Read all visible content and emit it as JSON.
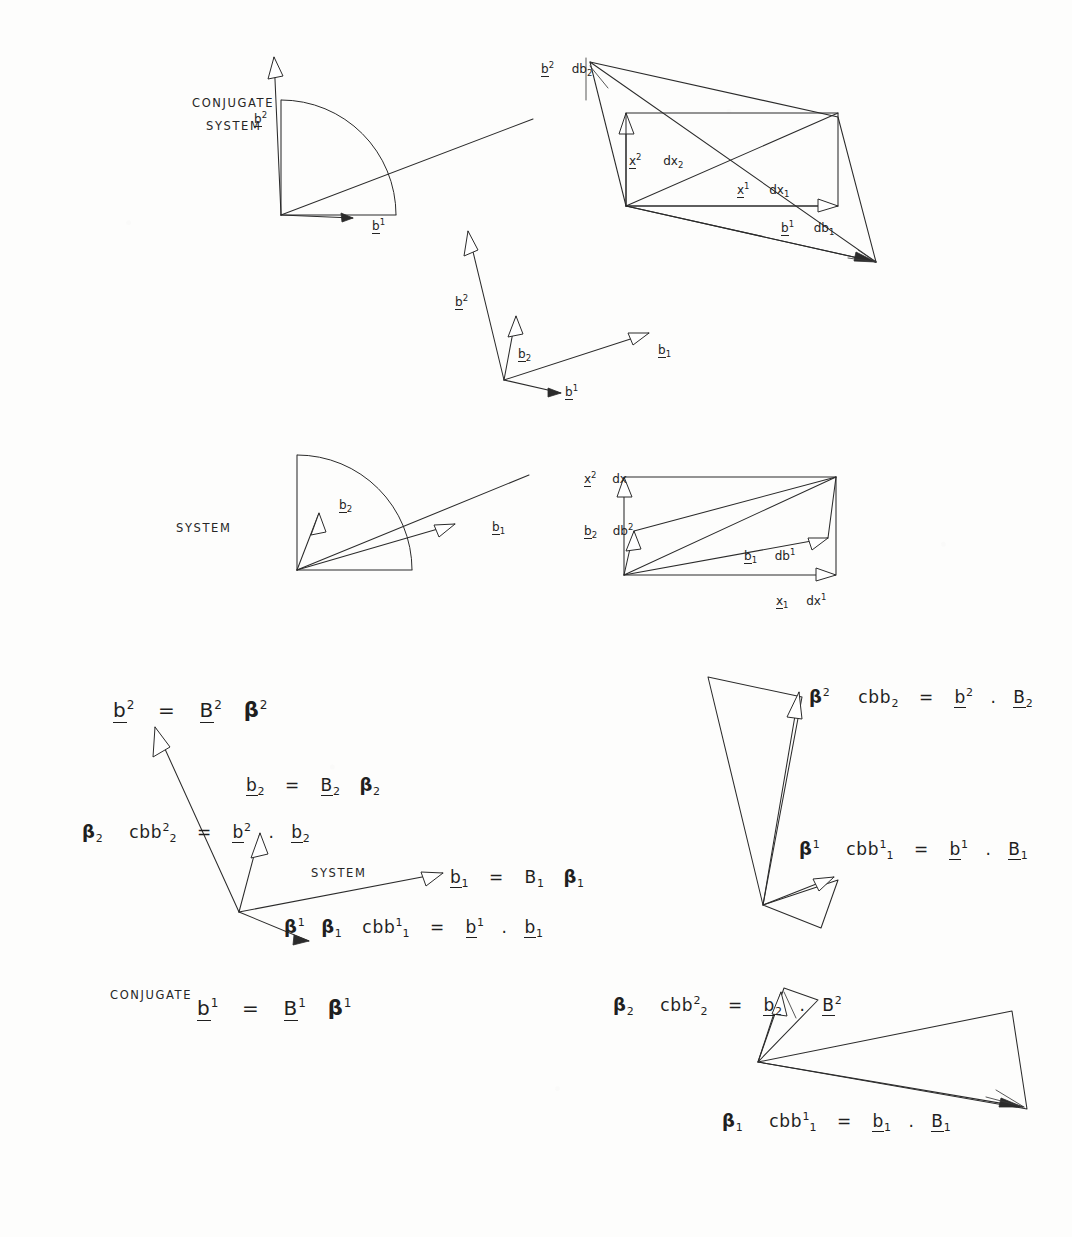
{
  "page": {
    "width": 1072,
    "height": 1237,
    "ink_color": "#2b2b2b",
    "paper_color": "#fdfdfc"
  },
  "captions": {
    "conjugate_system_top_line1": "CONJUGATE",
    "conjugate_system_top_line2": "SYSTEM",
    "system_middle": "SYSTEM",
    "system_lower": "SYSTEM",
    "conjugate_lower": "CONJUGATE"
  },
  "fig_top_left": {
    "name": "conjugate-system-quadrant",
    "labels": [
      {
        "base": "b",
        "sup": "2",
        "sub": "",
        "underline": true
      },
      {
        "base": "b",
        "sup": "1",
        "sub": "",
        "underline": true
      }
    ]
  },
  "fig_top_right": {
    "name": "conjugate-differential-parallelogram",
    "labels": [
      {
        "base": "b",
        "sup": "2",
        "sub": "2",
        "suffix": "db",
        "underline": true
      },
      {
        "base": "x",
        "sup": "2",
        "sub": "2",
        "suffix": "dx",
        "underline": true
      },
      {
        "base": "x",
        "sup": "1",
        "sub": "1",
        "suffix": "dx",
        "underline": true
      },
      {
        "base": "b",
        "sup": "1",
        "sub": "1",
        "suffix": "db",
        "underline": true
      }
    ]
  },
  "fig_middle": {
    "name": "combined-basis-vectors",
    "labels": [
      {
        "base": "b",
        "sup": "2",
        "sub": "",
        "underline": true
      },
      {
        "base": "b",
        "sup": "",
        "sub": "2",
        "underline": true
      },
      {
        "base": "b",
        "sup": "",
        "sub": "1",
        "underline": true
      },
      {
        "base": "b",
        "sup": "1",
        "sub": "",
        "underline": true
      }
    ]
  },
  "fig_row2_left": {
    "name": "system-quadrant",
    "labels": [
      {
        "base": "b",
        "sup": "",
        "sub": "2",
        "underline": true
      },
      {
        "base": "b",
        "sup": "",
        "sub": "1",
        "underline": true
      }
    ]
  },
  "fig_row2_right": {
    "name": "system-differential-parallelogram",
    "labels": [
      {
        "base": "x",
        "sup": "2",
        "sub": "2",
        "suffix": "dx",
        "underline": true
      },
      {
        "base": "b",
        "sup": "2",
        "sub": "2",
        "suffix": "db",
        "underline": true
      },
      {
        "base": "b",
        "sup": "",
        "sub": "1",
        "suffix": "db",
        "sup2": "1",
        "underline": true
      },
      {
        "base": "x",
        "sup": "1",
        "sub": "1",
        "suffix": "dx",
        "underline": true
      }
    ]
  },
  "equations": {
    "left_block": [
      {
        "id": "eq-b2-contra",
        "parts": [
          {
            "t": "b",
            "sup": "2",
            "u": true
          },
          {
            "t": "="
          },
          {
            "t": "B",
            "sup": "2",
            "u": true
          },
          {
            "t": "β",
            "sup": "2",
            "greek": true
          }
        ],
        "plain": "b^2 = B^2 β^2"
      },
      {
        "id": "eq-b2-co",
        "parts": [
          {
            "t": "b",
            "sub": "2",
            "u": true
          },
          {
            "t": "="
          },
          {
            "t": "B",
            "sub": "2",
            "u": true
          },
          {
            "t": "β",
            "sub": "2",
            "greek": true
          }
        ],
        "plain": "b_2 = B_2 β_2"
      },
      {
        "id": "eq-beta2-cbb",
        "parts": [
          {
            "t": "β",
            "sub": "2",
            "greek": true
          },
          {
            "t": "cbb",
            "sup": "2",
            "sub": "2"
          },
          {
            "t": "="
          },
          {
            "t": "b",
            "sup": "2",
            "u": true
          },
          {
            "t": "."
          },
          {
            "t": "b",
            "sub": "2",
            "u": true
          }
        ],
        "plain": "β_2 cbb^2_2 = b^2 . b_2"
      },
      {
        "id": "eq-b1-co",
        "parts": [
          {
            "t": "b",
            "sub": "1",
            "u": true
          },
          {
            "t": "="
          },
          {
            "t": "B",
            "sub": "1",
            "u": true
          },
          {
            "t": "β",
            "sub": "1",
            "greek": true
          }
        ],
        "plain": "b_1 = B_1 β_1"
      },
      {
        "id": "eq-beta1-cbb",
        "parts": [
          {
            "t": "β",
            "sup": "1",
            "greek": true
          },
          {
            "t": "β",
            "sub": "1",
            "greek": true
          },
          {
            "t": "cbb",
            "sup": "1",
            "sub": "1"
          },
          {
            "t": "="
          },
          {
            "t": "b",
            "sup": "1",
            "u": true
          },
          {
            "t": "."
          },
          {
            "t": "b",
            "sub": "1",
            "u": true
          }
        ],
        "plain": "β^1 β_1 cbb^1_1 = b^1 . b_1"
      },
      {
        "id": "eq-b1-contra",
        "parts": [
          {
            "t": "b",
            "sup": "1",
            "u": true
          },
          {
            "t": "="
          },
          {
            "t": "B",
            "sup": "1",
            "u": true
          },
          {
            "t": "β",
            "sup": "1",
            "greek": true
          }
        ],
        "plain": "b^1 = B^1 β^1"
      }
    ],
    "right_block": [
      {
        "id": "eq-r-beta2",
        "parts": [
          {
            "t": "β",
            "sup": "2",
            "greek": true
          },
          {
            "t": "cbb",
            "sup": "2",
            "sub": "2"
          },
          {
            "t": "="
          },
          {
            "t": "b",
            "sup": "2",
            "u": true
          },
          {
            "t": "."
          },
          {
            "t": "B",
            "sub": "2",
            "u": true
          }
        ],
        "plain": "β^2 cbb^2_2 = b^2 . B_2"
      },
      {
        "id": "eq-r-beta1",
        "parts": [
          {
            "t": "β",
            "sup": "1",
            "greek": true
          },
          {
            "t": "cbb",
            "sup": "1",
            "sub": "1"
          },
          {
            "t": "="
          },
          {
            "t": "b",
            "sup": "1",
            "u": true
          },
          {
            "t": "."
          },
          {
            "t": "B",
            "sub": "1",
            "u": true
          }
        ],
        "plain": "β^1 cbb^1_1 = b^1 . B_1"
      },
      {
        "id": "eq-r-beta2-sub",
        "parts": [
          {
            "t": "β",
            "sub": "2",
            "greek": true
          },
          {
            "t": "cbb",
            "sup": "2",
            "sub": "2"
          },
          {
            "t": "="
          },
          {
            "t": "b",
            "sub": "2",
            "u": true
          },
          {
            "t": "."
          },
          {
            "t": "B",
            "sup": "2",
            "u": true
          }
        ],
        "plain": "β_2 cbb^2_2 = b_2 . B^2"
      },
      {
        "id": "eq-r-beta1-sub",
        "parts": [
          {
            "t": "β",
            "sub": "1",
            "greek": true
          },
          {
            "t": "cbb",
            "sup": "1",
            "sub": "1"
          },
          {
            "t": "="
          },
          {
            "t": "b",
            "sub": "1",
            "u": true
          },
          {
            "t": "."
          },
          {
            "t": "B",
            "sub": "1",
            "u": true
          }
        ],
        "plain": "β_1 cbb^1_1 = b_1 . B_1"
      }
    ]
  },
  "label_text": {
    "b_sup2": "b",
    "b_sup1": "b",
    "b_sub2": "b",
    "b_sub1": "b",
    "db": "db",
    "dx": "dx",
    "x": "x",
    "one": "1",
    "two": "2",
    "equals": "=",
    "dot": ".",
    "beta": "β",
    "cap_b": "B",
    "cbb": "cbb"
  }
}
